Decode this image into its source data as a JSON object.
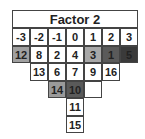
{
  "title": "Factor 2",
  "columns": [
    "-3",
    "-2",
    "-1",
    "0",
    "1",
    "2",
    "3"
  ],
  "rows": [
    [
      {
        "col": 0,
        "value": "12",
        "shade": "#a0a0a0"
      },
      {
        "col": 1,
        "value": "8",
        "shade": "#ffffff"
      },
      {
        "col": 2,
        "value": "2",
        "shade": "#ffffff"
      },
      {
        "col": 3,
        "value": "4",
        "shade": "#ffffff"
      },
      {
        "col": 4,
        "value": "3",
        "shade": "#a8a8a8"
      },
      {
        "col": 5,
        "value": "1",
        "shade": "#5a5a5a"
      },
      {
        "col": 6,
        "value": "5",
        "shade": "#3a3a3a"
      }
    ],
    [
      {
        "col": 1,
        "value": "13",
        "shade": "#ffffff"
      },
      {
        "col": 2,
        "value": "6",
        "shade": "#ffffff"
      },
      {
        "col": 3,
        "value": "7",
        "shade": "#ffffff"
      },
      {
        "col": 4,
        "value": "9",
        "shade": "#ffffff"
      },
      {
        "col": 5,
        "value": "16",
        "shade": "#ffffff"
      }
    ],
    [
      {
        "col": 2,
        "value": "14",
        "shade": "#9a9a9a"
      },
      {
        "col": 3,
        "value": "10",
        "shade": "#5a5a5a"
      },
      {
        "col": 4,
        "value": "",
        "shade": "#ffffff"
      }
    ],
    [
      {
        "col": 3,
        "value": "11",
        "shade": "#ffffff"
      }
    ],
    [
      {
        "col": 3,
        "value": "15",
        "shade": "#ffffff"
      }
    ]
  ]
}
